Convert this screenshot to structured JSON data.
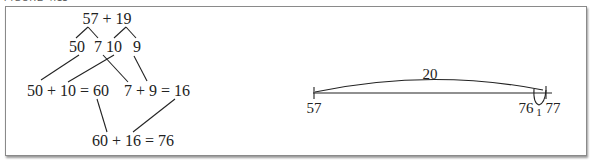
{
  "figure": {
    "caption": "FIGURE 4.11"
  },
  "decomposition_diagram": {
    "top_expression": "57 + 19",
    "parts": [
      "50",
      "7",
      "10",
      "9"
    ],
    "partial_sum_tens": "50 + 10 = 60",
    "partial_sum_ones": "7 + 9 = 16",
    "final_sum": "60 + 16 = 76"
  },
  "number_line": {
    "start_label": "57",
    "jump_label": "20",
    "label_76": "76",
    "back_jump_label": "1",
    "end_label": "77"
  }
}
